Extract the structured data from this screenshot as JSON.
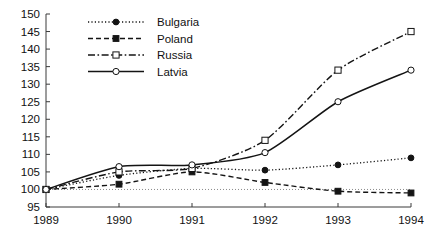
{
  "chart_data": {
    "type": "line",
    "title": "",
    "subtitle": "",
    "xlabel": "",
    "ylabel": "",
    "x": [
      1989,
      1990,
      1991,
      1992,
      1993,
      1994
    ],
    "xtick_labels": [
      "1989",
      "1990",
      "1991",
      "1992",
      "1993",
      "1994"
    ],
    "xlim": [
      1989,
      1994
    ],
    "ylim": [
      95,
      150
    ],
    "ytick_labels": [
      "95",
      "100",
      "105",
      "110",
      "115",
      "120",
      "125",
      "130",
      "135",
      "140",
      "145",
      "150"
    ],
    "yticks": [
      95,
      100,
      105,
      110,
      115,
      120,
      125,
      130,
      135,
      140,
      145,
      150
    ],
    "grid": false,
    "legend_position": "upper-left-inside",
    "reference_line": {
      "value": 100,
      "style": "dotted"
    },
    "series": [
      {
        "name": "Bulgaria",
        "values": [
          100,
          104,
          106,
          105.5,
          107,
          109
        ],
        "line_style": "dotted",
        "marker": "filled-circle",
        "color": "#141414"
      },
      {
        "name": "Poland",
        "values": [
          100,
          101.5,
          105,
          102,
          99.5,
          99
        ],
        "line_style": "dashed",
        "marker": "filled-square",
        "color": "#141414"
      },
      {
        "name": "Russia",
        "values": [
          100,
          105,
          106,
          114,
          134,
          145
        ],
        "line_style": "dash-dot",
        "marker": "open-square",
        "color": "#141414"
      },
      {
        "name": "Latvia",
        "values": [
          100,
          106.5,
          107,
          110.5,
          125,
          134
        ],
        "line_style": "solid",
        "marker": "open-circle",
        "color": "#141414"
      }
    ]
  },
  "legend": {
    "entries": [
      {
        "label": "Bulgaria"
      },
      {
        "label": "Poland"
      },
      {
        "label": "Russia"
      },
      {
        "label": "Latvia"
      }
    ]
  }
}
